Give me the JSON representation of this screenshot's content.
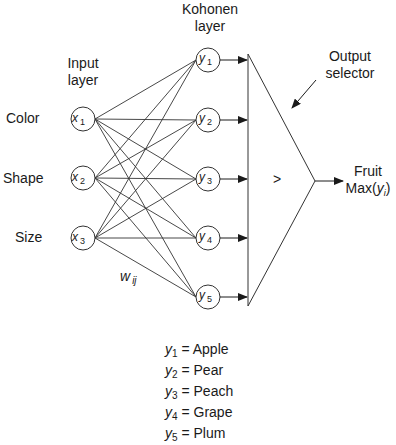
{
  "diagram": {
    "title_labels": {
      "kohonen_layer": [
        "Kohonen",
        "layer"
      ],
      "input_layer": [
        "Input",
        "layer"
      ],
      "output_selector": [
        "Output",
        "selector"
      ],
      "output": [
        "Fruit",
        "Max(",
        "y",
        "i",
        ")"
      ],
      "weight": "w",
      "weight_sub": "ij",
      "comparator_symbol": ">"
    },
    "inputs": [
      {
        "feature": "Color",
        "var": "x",
        "sub": "1"
      },
      {
        "feature": "Shape",
        "var": "x",
        "sub": "2"
      },
      {
        "feature": "Size",
        "var": "x",
        "sub": "3"
      }
    ],
    "kohonen_nodes": [
      {
        "var": "y",
        "sub": "1"
      },
      {
        "var": "y",
        "sub": "2"
      },
      {
        "var": "y",
        "sub": "3"
      },
      {
        "var": "y",
        "sub": "4"
      },
      {
        "var": "y",
        "sub": "5"
      }
    ],
    "legend": [
      {
        "var": "y",
        "sub": "1",
        "eq": "= Apple"
      },
      {
        "var": "y",
        "sub": "2",
        "eq": "= Pear"
      },
      {
        "var": "y",
        "sub": "3",
        "eq": "= Peach"
      },
      {
        "var": "y",
        "sub": "4",
        "eq": "= Grape"
      },
      {
        "var": "y",
        "sub": "5",
        "eq": "= Plum"
      }
    ],
    "colors": {
      "stroke": "#333333",
      "background": "#ffffff"
    }
  }
}
